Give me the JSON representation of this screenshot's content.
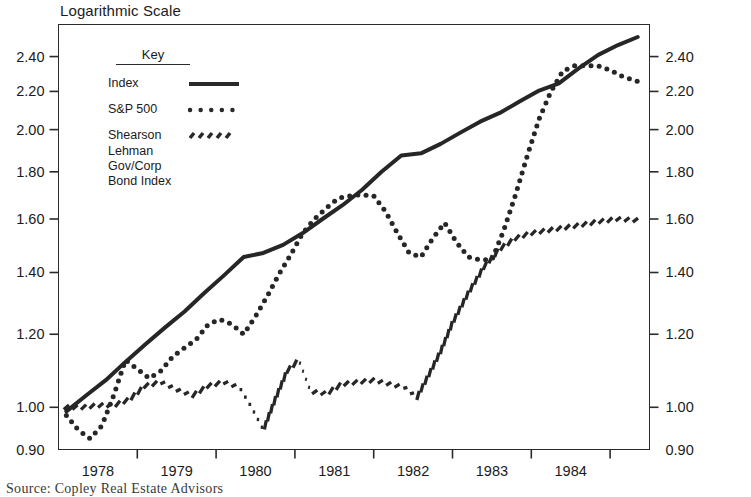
{
  "title": "Logarithmic Scale",
  "source_note": "Source: Copley Real Estate Advisors",
  "legend": {
    "heading": "Key",
    "entries": [
      {
        "label": "Index",
        "style": "solid"
      },
      {
        "label": "S&P 500",
        "style": "dotted"
      },
      {
        "label": "Shearson Lehman Gov/Corp Bond Index",
        "style": "dashed"
      }
    ]
  },
  "chart_data": {
    "type": "line",
    "title": "Logarithmic Scale",
    "xlabel": "",
    "ylabel": "",
    "scale": "log",
    "grid": false,
    "legend_position": "inside-top-left",
    "ylim": [
      0.9,
      2.6
    ],
    "ytick_labels": [
      "2.40",
      "2.20",
      "2.00",
      "1.80",
      "1.60",
      "1.40",
      "1.20",
      "1.00",
      "0.90"
    ],
    "yticks": [
      2.4,
      2.2,
      2.0,
      1.8,
      1.6,
      1.4,
      1.2,
      1.0,
      0.9
    ],
    "dual_y_axis": true,
    "xlim": [
      1977.5,
      1985.0
    ],
    "xtick_labels": [
      "1978",
      "1979",
      "1980",
      "1981",
      "1982",
      "1983",
      "1984"
    ],
    "xticks": [
      1978,
      1979,
      1980,
      1981,
      1982,
      1983,
      1984
    ],
    "series": [
      {
        "name": "Index",
        "style": "solid",
        "x": [
          1977.6,
          1977.85,
          1978.1,
          1978.35,
          1978.6,
          1978.85,
          1979.1,
          1979.35,
          1979.6,
          1979.85,
          1980.1,
          1980.35,
          1980.6,
          1980.85,
          1981.1,
          1981.35,
          1981.6,
          1981.85,
          1982.1,
          1982.35,
          1982.6,
          1982.85,
          1983.1,
          1983.35,
          1983.6,
          1983.85,
          1984.1,
          1984.35,
          1984.6,
          1984.85
        ],
        "values": [
          0.99,
          1.03,
          1.07,
          1.12,
          1.17,
          1.22,
          1.27,
          1.33,
          1.39,
          1.455,
          1.47,
          1.5,
          1.545,
          1.6,
          1.655,
          1.72,
          1.8,
          1.875,
          1.885,
          1.93,
          1.985,
          2.04,
          2.085,
          2.145,
          2.205,
          2.245,
          2.33,
          2.41,
          2.47,
          2.52
        ]
      },
      {
        "name": "S&P 500",
        "style": "dotted",
        "x": [
          1977.6,
          1977.75,
          1977.9,
          1978.05,
          1978.2,
          1978.35,
          1978.5,
          1978.65,
          1978.8,
          1978.95,
          1979.1,
          1979.25,
          1979.4,
          1979.55,
          1979.7,
          1979.85,
          1980.0,
          1980.15,
          1980.3,
          1980.45,
          1980.6,
          1980.75,
          1980.9,
          1981.05,
          1981.2,
          1981.35,
          1981.5,
          1981.65,
          1981.8,
          1981.95,
          1982.1,
          1982.25,
          1982.4,
          1982.55,
          1982.7,
          1982.85,
          1983.0,
          1983.15,
          1983.3,
          1983.45,
          1983.6,
          1983.75,
          1983.9,
          1984.05,
          1984.2,
          1984.35,
          1984.5,
          1984.65,
          1984.85
        ],
        "values": [
          0.98,
          0.945,
          0.925,
          0.955,
          1.03,
          1.125,
          1.1,
          1.075,
          1.095,
          1.135,
          1.16,
          1.185,
          1.23,
          1.245,
          1.23,
          1.2,
          1.255,
          1.32,
          1.395,
          1.465,
          1.545,
          1.6,
          1.645,
          1.685,
          1.695,
          1.7,
          1.695,
          1.63,
          1.545,
          1.47,
          1.455,
          1.525,
          1.585,
          1.51,
          1.455,
          1.445,
          1.445,
          1.555,
          1.7,
          1.875,
          2.055,
          2.2,
          2.315,
          2.345,
          2.345,
          2.345,
          2.32,
          2.285,
          2.255
        ]
      },
      {
        "name": "Shearson Lehman Gov/Corp Bond Index",
        "style": "dashed",
        "x": [
          1977.6,
          1977.8,
          1978.0,
          1978.2,
          1978.4,
          1978.6,
          1978.8,
          1979.0,
          1979.2,
          1979.4,
          1979.6,
          1979.8,
          1979.95,
          1980.1,
          1980.25,
          1980.4,
          1980.55,
          1980.7,
          1980.9,
          1981.1,
          1981.3,
          1981.5,
          1981.7,
          1981.9,
          1982.05,
          1982.2,
          1982.35,
          1982.5,
          1982.7,
          1982.9,
          1983.1,
          1983.3,
          1983.5,
          1983.7,
          1983.9,
          1984.1,
          1984.35,
          1984.6,
          1984.85
        ],
        "values": [
          1.0,
          1.0,
          1.005,
          1.005,
          1.02,
          1.055,
          1.065,
          1.045,
          1.03,
          1.055,
          1.065,
          1.05,
          1.0,
          0.945,
          1.02,
          1.095,
          1.125,
          1.04,
          1.035,
          1.06,
          1.065,
          1.07,
          1.06,
          1.05,
          1.025,
          1.085,
          1.15,
          1.235,
          1.33,
          1.42,
          1.485,
          1.525,
          1.545,
          1.555,
          1.565,
          1.575,
          1.59,
          1.6,
          1.595
        ]
      }
    ]
  },
  "axes": {
    "left_ticks": [
      "2.40",
      "2.20",
      "2.00",
      "1.80",
      "1.60",
      "1.40",
      "1.20",
      "1.00",
      "0.90"
    ],
    "right_ticks": [
      "2.40",
      "2.20",
      "2.00",
      "1.80",
      "1.60",
      "1.40",
      "1.20",
      "1.00",
      "0.90"
    ],
    "x_ticks": [
      "1978",
      "1979",
      "1980",
      "1981",
      "1982",
      "1983",
      "1984"
    ]
  }
}
